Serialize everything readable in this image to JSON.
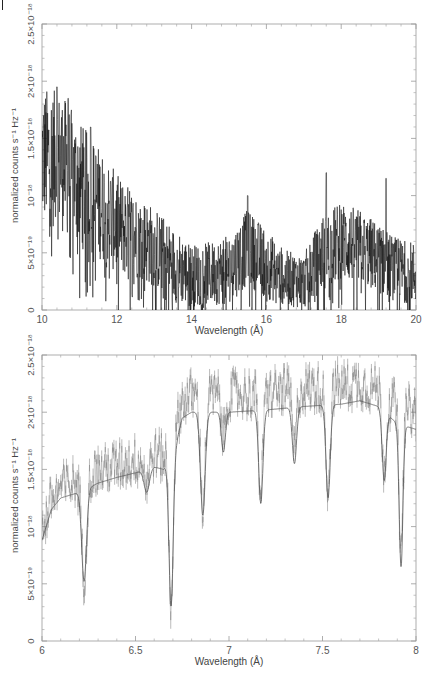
{
  "chart_data": [
    {
      "type": "line",
      "title": "",
      "xlabel": "Wavelength (Å)",
      "ylabel": "normalized counts s⁻¹ Hz⁻¹",
      "xlim": [
        10,
        20
      ],
      "ylim": [
        0,
        2.5e-18
      ],
      "xticks": [
        10,
        12,
        14,
        16,
        18,
        20
      ],
      "xtick_labels": [
        "10",
        "12",
        "14",
        "16",
        "18",
        "20"
      ],
      "yticks": [
        0,
        5e-19,
        1e-18,
        1.5e-18,
        2e-18,
        2.5e-18
      ],
      "ytick_labels": [
        "0",
        "5×10⁻¹⁹",
        "10⁻¹⁸",
        "1.5×10⁻¹⁸",
        "2×10⁻¹⁸",
        "2.5×10⁻¹⁸"
      ],
      "grid": false,
      "legend": null,
      "series": [
        {
          "name": "observed spectrum (noisy data)",
          "color": "#111111",
          "envelope_x": [
            10,
            10.5,
            11,
            11.5,
            12,
            12.5,
            13,
            13.5,
            14,
            14.5,
            15,
            15.5,
            16,
            16.5,
            17,
            17.5,
            18,
            18.5,
            19,
            19.5,
            20
          ],
          "envelope_mean": [
            1.35e-18,
            1.3e-18,
            1.1e-18,
            9.5e-19,
            7.5e-19,
            6.5e-19,
            5.5e-19,
            4e-19,
            3e-19,
            3.2e-19,
            3.5e-19,
            5.5e-19,
            4e-19,
            2.8e-19,
            2.5e-19,
            5e-19,
            6e-19,
            5.5e-19,
            4.5e-19,
            3.5e-19,
            3.2e-19
          ],
          "envelope_spread": [
            5.5e-19,
            5.5e-19,
            5e-19,
            4.5e-19,
            4e-19,
            3.5e-19,
            3.2e-19,
            3e-19,
            2.5e-19,
            2.5e-19,
            2.8e-19,
            3e-19,
            2.8e-19,
            2.2e-19,
            2.2e-19,
            3e-19,
            3.2e-19,
            3e-19,
            2.8e-19,
            2.5e-19,
            2.5e-19
          ],
          "peaks": [
            [
              10.4,
              1.95e-18
            ],
            [
              10.7,
              1.85e-18
            ],
            [
              11.3,
              1.6e-18
            ],
            [
              15.5,
              1e-18
            ],
            [
              17.6,
              1.2e-18
            ],
            [
              19.2,
              1.15e-18
            ]
          ]
        }
      ]
    },
    {
      "type": "line",
      "title": "",
      "xlabel": "Wavelength (Å)",
      "ylabel": "normalized counts s⁻¹ Hz⁻¹",
      "xlim": [
        6,
        8
      ],
      "ylim": [
        0,
        2.5e-18
      ],
      "xticks": [
        6,
        6.5,
        7,
        7.5,
        8
      ],
      "xtick_labels": [
        "6",
        "6.5",
        "7",
        "7.5",
        "8"
      ],
      "yticks": [
        0,
        5e-19,
        1e-18,
        1.5e-18,
        2e-18,
        2.5e-18
      ],
      "ytick_labels": [
        "0",
        "5×10⁻¹⁹",
        "10⁻¹⁸",
        "1.5×10⁻¹⁸",
        "2×10⁻¹⁸",
        "2.5×10⁻¹⁸"
      ],
      "grid": false,
      "legend": null,
      "series": [
        {
          "name": "model",
          "color": "#555555",
          "continuum_x": [
            6.0,
            6.05,
            6.1,
            6.2,
            6.3,
            6.4,
            6.5,
            6.6,
            6.65,
            6.72,
            6.75,
            6.8,
            7.0,
            7.2,
            7.4,
            7.6,
            7.7,
            7.8,
            7.9,
            8.0
          ],
          "continuum_y": [
            8.8e-19,
            1.15e-18,
            1.25e-18,
            1.3e-18,
            1.38e-18,
            1.43e-18,
            1.47e-18,
            1.52e-18,
            1.5e-18,
            1.75e-18,
            1.95e-18,
            2e-18,
            2e-18,
            2.02e-18,
            2.05e-18,
            2.07e-18,
            2.1e-18,
            2.05e-18,
            1.9e-18,
            1.85e-18
          ],
          "absorption_lines": [
            {
              "x": 6.225,
              "depth_to": 5.2e-19,
              "width": 0.018
            },
            {
              "x": 6.56,
              "depth_to": 1.3e-18,
              "width": 0.02
            },
            {
              "x": 6.69,
              "depth_to": 3e-19,
              "width": 0.016
            },
            {
              "x": 6.86,
              "depth_to": 1.1e-18,
              "width": 0.018
            },
            {
              "x": 6.97,
              "depth_to": 1.65e-18,
              "width": 0.015
            },
            {
              "x": 7.17,
              "depth_to": 1.2e-18,
              "width": 0.016
            },
            {
              "x": 7.35,
              "depth_to": 1.55e-18,
              "width": 0.016
            },
            {
              "x": 7.53,
              "depth_to": 1.25e-18,
              "width": 0.016
            },
            {
              "x": 7.83,
              "depth_to": 1.4e-18,
              "width": 0.015
            },
            {
              "x": 7.92,
              "depth_to": 6.5e-19,
              "width": 0.014
            }
          ]
        },
        {
          "name": "observed spectrum (data with error bars)",
          "color": "#777777",
          "offset_above_model": 1.5e-19,
          "scatter": 2e-19
        }
      ]
    }
  ],
  "page": {
    "panel_top": {
      "ylabel": "normalized counts s⁻¹ Hz⁻¹",
      "xlabel": "Wavelength (Å)"
    },
    "panel_bottom": {
      "ylabel": "normalized counts s⁻¹ Hz⁻¹",
      "xlabel": "Wavelength (Å)"
    }
  }
}
